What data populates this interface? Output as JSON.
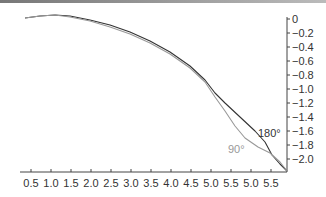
{
  "chart_data": {
    "type": "line",
    "title": "",
    "xlabel": "",
    "ylabel": "",
    "x_tick_labels": [
      "0.5",
      "1.0",
      "1.5",
      "2.0",
      "2.5",
      "3.0",
      "3.5",
      "4.0",
      "4.5",
      "5.0",
      "5.5",
      "5.0",
      "5.5"
    ],
    "y_tick_labels": [
      "0",
      "−0.2",
      "−0.4",
      "−0.6",
      "−0.8",
      "−1.0",
      "−1.2",
      "−1.4",
      "−1.6",
      "−1.8",
      "−2.0"
    ],
    "ylim": [
      -2.15,
      0.05
    ],
    "y_axis_position": "right",
    "grid": false,
    "legend": "none (inline labels)",
    "annotations": [
      {
        "text": "180°",
        "near_series": "180°",
        "x": 5.6,
        "y": -1.7
      },
      {
        "text": "90°",
        "near_series": "90°",
        "x": 5.3,
        "y": -1.85
      }
    ],
    "series": [
      {
        "name": "180°",
        "color": "#333333",
        "x": [
          0.4,
          0.8,
          1.1,
          1.5,
          2.0,
          2.5,
          3.0,
          3.5,
          4.0,
          4.5,
          5.0,
          5.3,
          5.6,
          5.9,
          6.1,
          6.3
        ],
        "y": [
          0.0,
          0.02,
          0.02,
          -0.01,
          -0.08,
          -0.17,
          -0.29,
          -0.45,
          -0.65,
          -0.88,
          -1.13,
          -1.32,
          -1.5,
          -1.68,
          -1.92,
          -2.15
        ]
      },
      {
        "name": "90°",
        "color": "#999999",
        "x": [
          0.4,
          0.8,
          1.1,
          1.5,
          2.0,
          2.5,
          3.0,
          3.5,
          4.0,
          4.5,
          5.0,
          5.3,
          5.6,
          5.9,
          6.1,
          6.3
        ],
        "y": [
          0.0,
          0.02,
          0.02,
          -0.02,
          -0.1,
          -0.19,
          -0.31,
          -0.47,
          -0.66,
          -0.9,
          -1.16,
          -1.4,
          -1.68,
          -1.86,
          -1.98,
          -2.15
        ]
      }
    ]
  }
}
